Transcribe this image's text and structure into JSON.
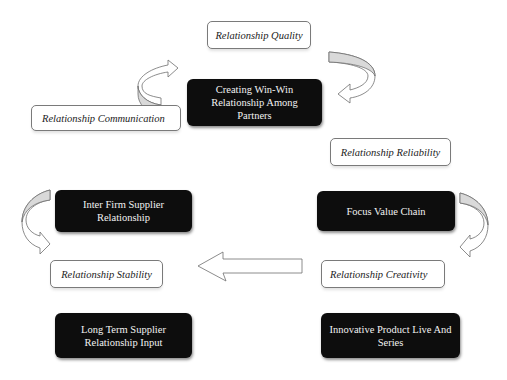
{
  "diagram": {
    "center": {
      "label": "Creating Win-Win Relationship Among Partners"
    },
    "relationship_labels": {
      "quality": "Relationship Quality",
      "communication": "Relationship Communication",
      "reliability": "Relationship Reliability",
      "stability": "Relationship Stability",
      "creativity": "Relationship Creativity"
    },
    "nodes": {
      "inter_firm": "Inter Firm Supplier Relationship",
      "focus_value_chain": "Focus Value Chain",
      "long_term": "Long Term Supplier Relationship Input",
      "innovative_product": "Innovative Product Live And Series"
    },
    "colors": {
      "dark_box": "#0d0d0d",
      "light_box_border": "#7a7a7a",
      "arrow_fill": "#d9d9d9",
      "arrow_stroke": "#6e6e6e"
    }
  }
}
